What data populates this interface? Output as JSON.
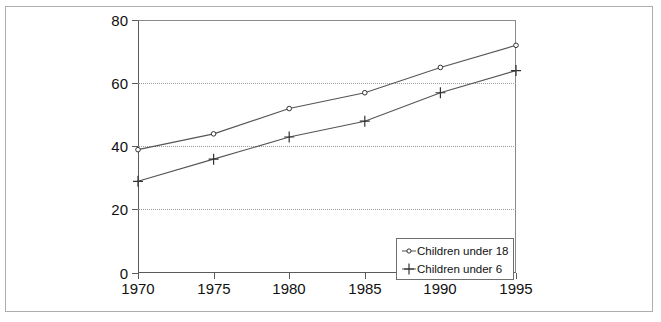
{
  "chart_data": {
    "type": "line",
    "title": "",
    "subtitle": "",
    "xlabel": "",
    "ylabel": "",
    "categories": [
      "1970",
      "1975",
      "1980",
      "1985",
      "1990",
      "1995"
    ],
    "x": [
      1970,
      1975,
      1980,
      1985,
      1990,
      1995
    ],
    "series": [
      {
        "name": "Children under 18",
        "marker": "circle",
        "values": [
          39,
          44,
          52,
          57,
          65,
          72
        ]
      },
      {
        "name": "Children under 6",
        "marker": "plus",
        "values": [
          29,
          36,
          43,
          48,
          57,
          64
        ]
      }
    ],
    "xlim": [
      1970,
      1995
    ],
    "ylim": [
      0,
      80
    ],
    "yticks": [
      0,
      20,
      40,
      60,
      80
    ],
    "ytick_labels": [
      "0",
      "20",
      "40",
      "60",
      "80"
    ],
    "xticks": [
      1970,
      1975,
      1980,
      1985,
      1990,
      1995
    ],
    "xtick_labels": [
      "1970",
      "1975",
      "1980",
      "1985",
      "1990",
      "1995"
    ],
    "grid": {
      "horizontal": true,
      "vertical": false,
      "style": "dotted",
      "at_values": [
        20,
        40,
        60
      ]
    },
    "legend": {
      "position": "bottom-right-inside",
      "entries": [
        "Children under 18",
        "Children under 6"
      ]
    },
    "colors": {
      "line": "#555555",
      "grid": "#9a9a9a",
      "axis": "#5a5a5a",
      "frame": "#adadad",
      "background": "#ffffff",
      "text": "#111111"
    }
  }
}
